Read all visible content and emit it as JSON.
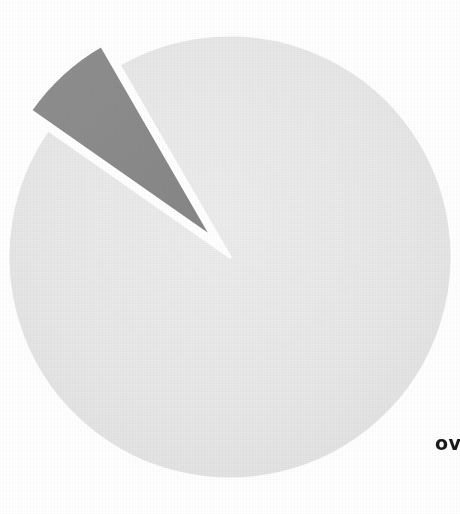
{
  "figure": {
    "name": "pie-chart-scan",
    "background_color": "#ffffff",
    "width": 460,
    "height": 514,
    "note_visible_text": "ov"
  },
  "annotations": {
    "clipped_label": {
      "text": "ov",
      "x": 435,
      "y": 434,
      "color": "#1a1a1a",
      "bold": true,
      "clipped_at_right_edge": true
    }
  },
  "chart_data": {
    "type": "pie",
    "title": "",
    "subtitle": "",
    "xlabel": "",
    "ylabel": "",
    "legend_position": "none",
    "grid": false,
    "labels_shown": false,
    "center": {
      "x": 230,
      "y": 257
    },
    "radius": 222,
    "start_angle_deg": 120,
    "direction": "counterclockwise",
    "cropped": true,
    "categories": [
      "Slice A",
      "Slice B"
    ],
    "values": [
      93,
      7
    ],
    "units": "percent",
    "series": [
      {
        "name": "Share",
        "values": [
          93,
          7
        ]
      }
    ],
    "slices": [
      {
        "label": "Slice A",
        "value": 93,
        "angle_deg": 335,
        "color": "#e8e8e8",
        "exploded": false,
        "explode_offset_px": 0,
        "start_deg": 145,
        "end_deg": 120
      },
      {
        "label": "Slice B",
        "value": 7,
        "angle_deg": 25,
        "color": "#8a8a8a",
        "exploded": true,
        "explode_offset_px": 26,
        "start_deg": 120,
        "end_deg": 145
      }
    ],
    "colors": [
      "#e8e8e8",
      "#8a8a8a"
    ],
    "edge_color": "#ffffff",
    "edge_width_px": 3
  }
}
